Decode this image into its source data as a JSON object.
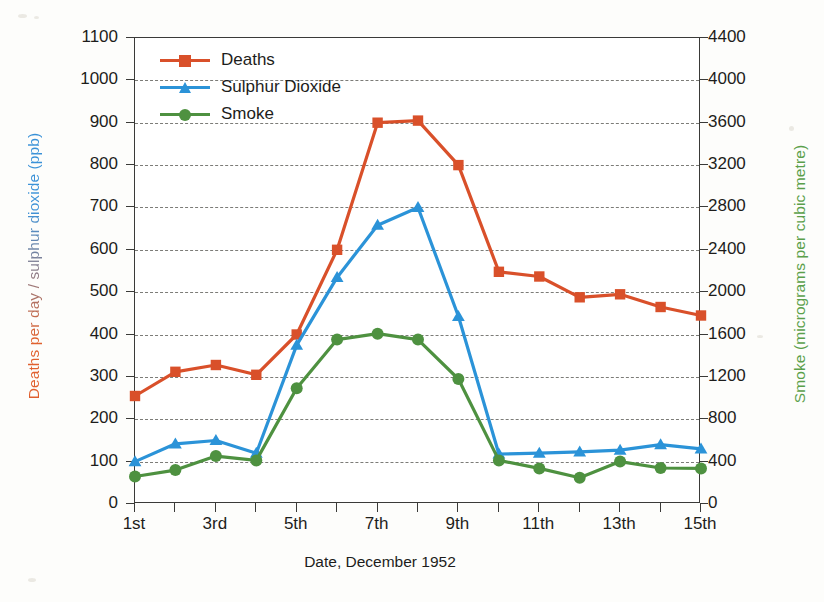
{
  "chart_data": {
    "type": "line",
    "title": "",
    "xlabel": "Date, December 1952",
    "ylabel_left": "Deaths per day / sulphur dioxide (ppb)",
    "ylabel_right": "Smoke (micrograms per cubic metre)",
    "grid": true,
    "legend_position": "top-left",
    "x": [
      1,
      2,
      3,
      4,
      5,
      6,
      7,
      8,
      9,
      10,
      11,
      12,
      13,
      14,
      15
    ],
    "categories": [
      "1st",
      "2nd",
      "3rd",
      "4th",
      "5th",
      "6th",
      "7th",
      "8th",
      "9th",
      "10th",
      "11th",
      "12th",
      "13th",
      "14th",
      "15th"
    ],
    "xtick_labels": [
      "1st",
      "",
      "3rd",
      "",
      "5th",
      "",
      "7th",
      "",
      "9th",
      "",
      "11th",
      "",
      "13th",
      "",
      "15th"
    ],
    "ylim_left": [
      0,
      1100
    ],
    "ytick_left": [
      0,
      100,
      200,
      300,
      400,
      500,
      600,
      700,
      800,
      900,
      1000,
      1100
    ],
    "ylim_right": [
      0,
      4400
    ],
    "ytick_right": [
      0,
      400,
      800,
      1200,
      1600,
      2000,
      2400,
      2800,
      3200,
      3600,
      4000,
      4400
    ],
    "series": [
      {
        "name": "Deaths",
        "axis": "left",
        "unit": "deaths per day",
        "color": "#d9502a",
        "marker": "square",
        "values": [
          255,
          312,
          328,
          305,
          400,
          600,
          900,
          905,
          800,
          548,
          537,
          488,
          495,
          465,
          445
        ]
      },
      {
        "name": "Sulphur Dioxide",
        "axis": "left",
        "unit": "ppb",
        "color": "#2b93d8",
        "marker": "triangle",
        "values": [
          100,
          142,
          150,
          120,
          375,
          535,
          658,
          700,
          443,
          118,
          120,
          123,
          127,
          140,
          130
        ]
      },
      {
        "name": "Smoke",
        "axis": "right",
        "unit": "micrograms per cubic metre",
        "color": "#4e9140",
        "marker": "circle",
        "values": [
          260,
          320,
          452,
          412,
          1092,
          1552,
          1608,
          1552,
          1180,
          412,
          336,
          248,
          400,
          340,
          336
        ],
        "values_left_scale": [
          65,
          80,
          113,
          103,
          273,
          388,
          402,
          388,
          295,
          103,
          84,
          62,
          100,
          85,
          84
        ]
      }
    ]
  },
  "legend": {
    "items": [
      {
        "label": "Deaths",
        "color": "#d9502a",
        "marker": "square"
      },
      {
        "label": "Sulphur Dioxide",
        "color": "#2b93d8",
        "marker": "triangle"
      },
      {
        "label": "Smoke",
        "color": "#4e9140",
        "marker": "circle"
      }
    ]
  },
  "axes": {
    "x_title": "Date, December 1952",
    "y_left_title": "Deaths per day / sulphur dioxide (ppb)",
    "y_right_title": "Smoke (micrograms per cubic metre)"
  }
}
